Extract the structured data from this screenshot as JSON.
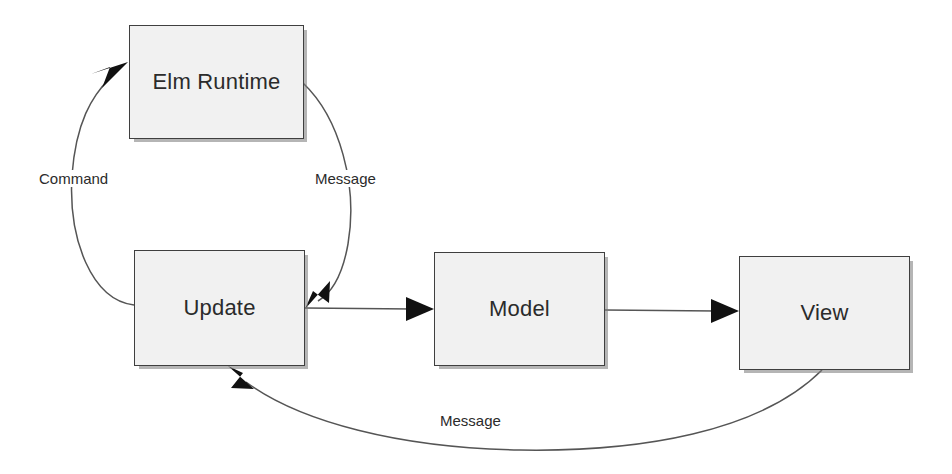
{
  "diagram": {
    "background_color": "#ffffff",
    "node_fill_color": "#f1f1f1",
    "node_border_color": "#3f3f3f",
    "edge_color": "#555555",
    "text_color": "#2b2b2b",
    "nodes": [
      {
        "id": "elm-runtime",
        "label": "Elm Runtime",
        "x": 129,
        "y": 25,
        "w": 175,
        "h": 114
      },
      {
        "id": "update",
        "label": "Update",
        "x": 134,
        "y": 250,
        "w": 171,
        "h": 116
      },
      {
        "id": "model",
        "label": "Model",
        "x": 434,
        "y": 252,
        "w": 171,
        "h": 114
      },
      {
        "id": "view",
        "label": "View",
        "x": 739,
        "y": 256,
        "w": 171,
        "h": 114
      }
    ],
    "edges": [
      {
        "id": "command",
        "label": "Command",
        "from": "update",
        "to": "elm-runtime",
        "label_x": 36,
        "label_y": 170
      },
      {
        "id": "message-top",
        "label": "Message",
        "from": "elm-runtime",
        "to": "update",
        "label_x": 312,
        "label_y": 170
      },
      {
        "id": "update-to-model",
        "label": "",
        "from": "update",
        "to": "model"
      },
      {
        "id": "model-to-view",
        "label": "",
        "from": "model",
        "to": "view"
      },
      {
        "id": "message-bottom",
        "label": "Message",
        "from": "view",
        "to": "update",
        "label_x": 437,
        "label_y": 412
      }
    ]
  }
}
